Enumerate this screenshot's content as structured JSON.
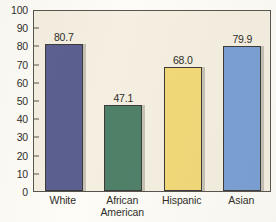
{
  "chart_data": {
    "type": "bar",
    "title": "",
    "xlabel": "",
    "ylabel": "",
    "categories": [
      "White",
      "African American",
      "Hispanic",
      "Asian"
    ],
    "category_lines": [
      [
        "White"
      ],
      [
        "African",
        "American"
      ],
      [
        "Hispanic"
      ],
      [
        "Asian"
      ]
    ],
    "values": [
      80.7,
      47.1,
      68.0,
      79.9
    ],
    "value_labels": [
      "80.7",
      "47.1",
      "68.0",
      "79.9"
    ],
    "bar_colors": [
      "#5b5f90",
      "#4f8068",
      "#f2d878",
      "#7a9fd4"
    ],
    "ylim": [
      0,
      100
    ],
    "ytick_step": 10,
    "ytick_labels": [
      "100",
      "90",
      "80",
      "70",
      "60",
      "50",
      "40",
      "30",
      "20",
      "10",
      "0"
    ],
    "ytick_values": [
      100,
      90,
      80,
      70,
      60,
      50,
      40,
      30,
      20,
      10,
      0
    ],
    "grid": false,
    "legend": false,
    "plot_background": "#f4efe0",
    "frame_color": "#575450"
  }
}
